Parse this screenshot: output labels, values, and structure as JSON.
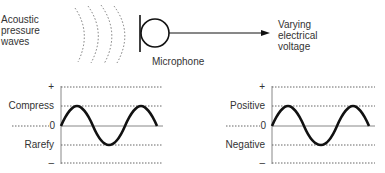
{
  "top": {
    "source_label": [
      "Acoustic",
      "pressure",
      "waves"
    ],
    "device_label": "Microphone",
    "output_label": [
      "Varying",
      "electrical",
      "voltage"
    ]
  },
  "left_chart": {
    "plus": "+",
    "upper": "Compress",
    "zero": "0",
    "lower": "Rarefy",
    "minus": "–"
  },
  "right_chart": {
    "plus": "+",
    "upper": "Positive",
    "zero": "0",
    "lower": "Negative",
    "minus": "–"
  },
  "colors": {
    "line": "#111111",
    "dotted": "#666666",
    "axis": "#888888",
    "text": "#333333"
  }
}
